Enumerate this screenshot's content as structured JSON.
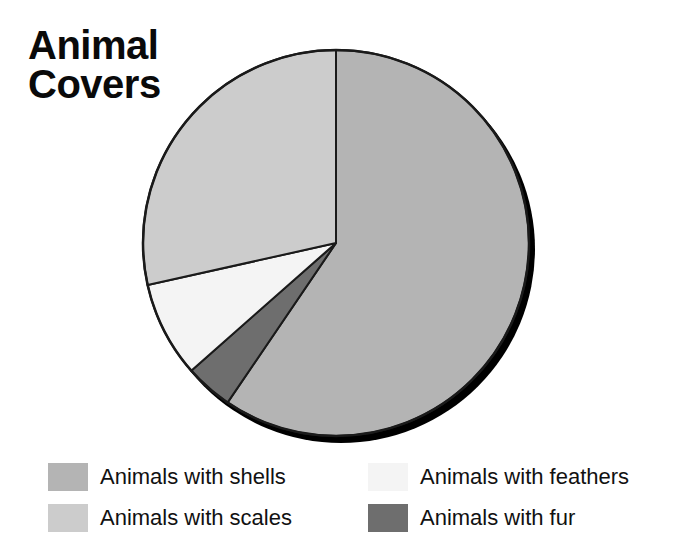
{
  "page": {
    "background": "#ffffff",
    "title": "Animal\nCovers",
    "title_color": "#0a0a0a"
  },
  "legend": {
    "position": "bottom",
    "columns": 2,
    "items": [
      {
        "label": "Animals with shells",
        "color": "#b4b4b4",
        "swatch_name": "legend-swatch-shells"
      },
      {
        "label": "Animals with feathers",
        "color": "#f4f4f4",
        "swatch_name": "legend-swatch-feathers"
      },
      {
        "label": "Animals with scales",
        "color": "#cccccc",
        "swatch_name": "legend-swatch-scales"
      },
      {
        "label": "Animals with fur",
        "color": "#6e6e6e",
        "swatch_name": "legend-swatch-fur"
      }
    ]
  },
  "chart_data": {
    "type": "pie",
    "title": "Animal Covers",
    "xlabel": "",
    "ylabel": "",
    "grid": false,
    "legend_position": "bottom",
    "start_angle_deg": 0,
    "direction": "clockwise",
    "center": {
      "x": 336,
      "y": 243
    },
    "radius": 193,
    "shadow_color": "#000000",
    "outline_color": "#1a1a1a",
    "categories": [
      "Animals with shells",
      "Animals with feathers",
      "Animals with fur",
      "Animals with scales"
    ],
    "values": [
      59.5,
      8.0,
      4.0,
      28.5
    ],
    "units": "percent",
    "slices": [
      {
        "label": "Animals with shells",
        "value": 59.5,
        "color": "#b4b4b4",
        "start_deg": 0.0,
        "end_deg": 214.2
      },
      {
        "label": "Animals with fur",
        "value": 4.0,
        "color": "#6e6e6e",
        "start_deg": 214.2,
        "end_deg": 228.6
      },
      {
        "label": "Animals with feathers",
        "value": 8.0,
        "color": "#f4f4f4",
        "start_deg": 228.6,
        "end_deg": 257.4
      },
      {
        "label": "Animals with scales",
        "value": 28.5,
        "color": "#cccccc",
        "start_deg": 257.4,
        "end_deg": 360.0
      }
    ]
  }
}
